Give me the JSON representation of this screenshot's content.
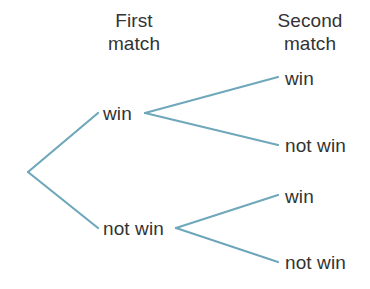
{
  "diagram": {
    "type": "probability-tree",
    "line_color": "#6fa7bb",
    "text_color": "#333333",
    "background_color": "#ffffff",
    "headings": {
      "first_match": {
        "line1": "First",
        "line2": "match"
      },
      "second_match": {
        "line1": "Second",
        "line2": "match"
      }
    },
    "stage1": {
      "win": "win",
      "not_win": "not win"
    },
    "stage2": {
      "win_win": "win",
      "win_not_win": "not win",
      "not_win_win": "win",
      "not_win_not_win": "not win"
    },
    "nodes": {
      "root": {
        "x": 28,
        "y": 172
      },
      "stage1_win": {
        "x": 145,
        "y": 113
      },
      "stage1_not_win": {
        "x": 176,
        "y": 228
      },
      "stage2_win_win": {
        "x": 278,
        "y": 77
      },
      "stage2_win_not_win": {
        "x": 278,
        "y": 145
      },
      "stage2_not_win_win": {
        "x": 278,
        "y": 195
      },
      "stage2_not_win_not_win": {
        "x": 278,
        "y": 262
      }
    },
    "branches": [
      {
        "name": "root-to-win",
        "x1": 28,
        "y1": 172,
        "x2": 98,
        "y2": 113
      },
      {
        "name": "root-to-not-win",
        "x1": 28,
        "y1": 172,
        "x2": 98,
        "y2": 228
      },
      {
        "name": "win-to-win",
        "x1": 145,
        "y1": 113,
        "x2": 278,
        "y2": 77
      },
      {
        "name": "win-to-not-win",
        "x1": 145,
        "y1": 113,
        "x2": 278,
        "y2": 145
      },
      {
        "name": "not-win-to-win",
        "x1": 176,
        "y1": 228,
        "x2": 278,
        "y2": 195
      },
      {
        "name": "not-win-to-not-win",
        "x1": 176,
        "y1": 228,
        "x2": 278,
        "y2": 262
      }
    ]
  }
}
